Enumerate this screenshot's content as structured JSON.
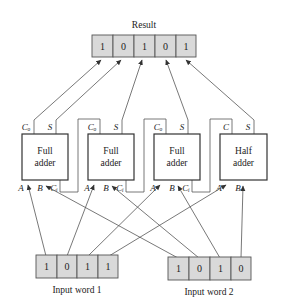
{
  "result": {
    "title": "Result",
    "bits": [
      "1",
      "0",
      "1",
      "0",
      "1"
    ]
  },
  "adders": [
    {
      "line1": "Full",
      "line2": "adder",
      "out_carry": "Cₒ",
      "out_sum": "S",
      "in_a": "A",
      "in_b": "B",
      "in_c": "Cᵢ"
    },
    {
      "line1": "Full",
      "line2": "adder",
      "out_carry": "Cₒ",
      "out_sum": "S",
      "in_a": "A",
      "in_b": "B",
      "in_c": "Cᵢ"
    },
    {
      "line1": "Full",
      "line2": "adder",
      "out_carry": "Cₒ",
      "out_sum": "S",
      "in_a": "A",
      "in_b": "B",
      "in_c": "Cᵢ"
    },
    {
      "line1": "Half",
      "line2": "adder",
      "out_carry": "C",
      "out_sum": "S",
      "in_a": "A",
      "in_b": "B"
    }
  ],
  "input_word_1": {
    "label": "Input word 1",
    "bits": [
      "1",
      "0",
      "1",
      "1"
    ]
  },
  "input_word_2": {
    "label": "Input word 2",
    "bits": [
      "1",
      "0",
      "1",
      "0"
    ]
  }
}
